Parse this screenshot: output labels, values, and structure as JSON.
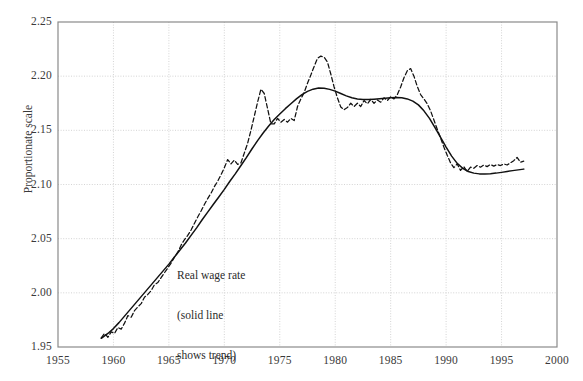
{
  "chart_data": {
    "type": "line",
    "title": "",
    "subtitle": "",
    "xlabel": "",
    "ylabel": "Proportionate scale",
    "xlim": [
      1955,
      2000
    ],
    "ylim": [
      1.95,
      2.25
    ],
    "xticks": [
      1955,
      1960,
      1965,
      1970,
      1975,
      1980,
      1985,
      1990,
      1995,
      2000
    ],
    "xtick_labels": [
      "1955",
      "1960",
      "1965",
      "1970",
      "1975",
      "1980",
      "1985",
      "1990",
      "1995",
      "2000"
    ],
    "yticks": [
      1.95,
      2.0,
      2.05,
      2.1,
      2.15,
      2.2,
      2.25
    ],
    "ytick_labels": [
      "1.95",
      "2.00",
      "2.05",
      "2.10",
      "2.15",
      "2.20",
      "2.25"
    ],
    "grid": true,
    "grid_style": "dotted",
    "grid_color": "#cfcfcf",
    "axis_color": "#8a8a8a",
    "legend": null,
    "legend_position": "none",
    "annotations": [
      {
        "name": "series-annotation",
        "lines": [
          "Real wage rate",
          "(solid line",
          "shows trend)"
        ],
        "x": 1965.8,
        "y": 2.047
      }
    ],
    "series": [
      {
        "name": "Real wage rate (actual)",
        "style": "dashed",
        "color": "#111111",
        "x": [
          1958.9,
          1959.2,
          1959.5,
          1959.8,
          1960.1,
          1960.4,
          1960.7,
          1961.0,
          1961.3,
          1961.6,
          1961.9,
          1962.2,
          1962.5,
          1962.8,
          1963.1,
          1963.4,
          1963.7,
          1964.0,
          1964.3,
          1964.6,
          1964.9,
          1965.2,
          1965.5,
          1965.8,
          1966.1,
          1966.4,
          1966.7,
          1967.0,
          1967.3,
          1967.6,
          1967.9,
          1968.2,
          1968.5,
          1968.8,
          1969.1,
          1969.4,
          1969.7,
          1970.0,
          1970.3,
          1970.6,
          1970.9,
          1971.2,
          1971.5,
          1971.8,
          1972.1,
          1972.4,
          1972.7,
          1973.0,
          1973.3,
          1973.6,
          1973.9,
          1974.2,
          1974.5,
          1974.8,
          1975.1,
          1975.4,
          1975.7,
          1976.0,
          1976.3,
          1976.6,
          1976.9,
          1977.2,
          1977.5,
          1977.8,
          1978.1,
          1978.4,
          1978.7,
          1979.0,
          1979.3,
          1979.6,
          1979.9,
          1980.2,
          1980.5,
          1980.8,
          1981.1,
          1981.4,
          1981.7,
          1982.0,
          1982.3,
          1982.6,
          1982.9,
          1983.2,
          1983.5,
          1983.8,
          1984.1,
          1984.4,
          1984.7,
          1985.0,
          1985.3,
          1985.6,
          1985.9,
          1986.2,
          1986.5,
          1986.8,
          1987.1,
          1987.4,
          1987.7,
          1988.0,
          1988.3,
          1988.6,
          1988.9,
          1989.2,
          1989.5,
          1989.8,
          1990.1,
          1990.4,
          1990.7,
          1991.0,
          1991.3,
          1991.6,
          1991.9,
          1992.2,
          1992.5,
          1992.8,
          1993.1,
          1993.4,
          1993.7,
          1994.0,
          1994.3,
          1994.6,
          1994.9,
          1995.2,
          1995.5,
          1995.8,
          1996.1,
          1996.4,
          1996.7,
          1997.0
        ],
        "y": [
          1.9585,
          1.9625,
          1.959,
          1.964,
          1.9625,
          1.968,
          1.9665,
          1.972,
          1.979,
          1.9775,
          1.9835,
          1.987,
          1.99,
          1.996,
          1.9985,
          2.002,
          2.0075,
          2.0095,
          2.014,
          2.0185,
          2.023,
          2.0275,
          2.033,
          2.0375,
          2.044,
          2.049,
          2.053,
          2.058,
          2.064,
          2.07,
          2.0755,
          2.0815,
          2.087,
          2.092,
          2.098,
          2.103,
          2.109,
          2.1155,
          2.123,
          2.119,
          2.1225,
          2.1185,
          2.12,
          2.129,
          2.138,
          2.15,
          2.163,
          2.176,
          2.188,
          2.184,
          2.17,
          2.156,
          2.156,
          2.161,
          2.1575,
          2.16,
          2.1575,
          2.161,
          2.159,
          2.172,
          2.179,
          2.185,
          2.1935,
          2.201,
          2.209,
          2.2165,
          2.2185,
          2.2175,
          2.213,
          2.202,
          2.19,
          2.18,
          2.1715,
          2.169,
          2.171,
          2.175,
          2.172,
          2.175,
          2.172,
          2.1775,
          2.1745,
          2.1785,
          2.175,
          2.178,
          2.176,
          2.18,
          2.1775,
          2.181,
          2.179,
          2.183,
          2.19,
          2.1985,
          2.205,
          2.207,
          2.2,
          2.1905,
          2.183,
          2.179,
          2.1745,
          2.168,
          2.1595,
          2.151,
          2.143,
          2.1345,
          2.127,
          2.12,
          2.1155,
          2.119,
          2.113,
          2.1165,
          2.112,
          2.116,
          2.115,
          2.1175,
          2.116,
          2.118,
          2.1165,
          2.1185,
          2.117,
          2.1185,
          2.1175,
          2.119,
          2.118,
          2.12,
          2.122,
          2.125,
          2.1205,
          2.1215
        ]
      },
      {
        "name": "Real wage rate (trend)",
        "style": "solid",
        "color": "#111111",
        "x": [
          1958.9,
          1959.5,
          1960.0,
          1960.5,
          1961.0,
          1961.5,
          1962.0,
          1962.5,
          1963.0,
          1963.5,
          1964.0,
          1964.5,
          1965.0,
          1965.5,
          1966.0,
          1966.5,
          1967.0,
          1967.5,
          1968.0,
          1968.5,
          1969.0,
          1969.5,
          1970.0,
          1970.5,
          1971.0,
          1971.5,
          1972.0,
          1972.5,
          1973.0,
          1973.5,
          1974.0,
          1974.5,
          1975.0,
          1975.5,
          1976.0,
          1976.5,
          1977.0,
          1977.5,
          1978.0,
          1978.5,
          1979.0,
          1979.5,
          1980.0,
          1980.5,
          1981.0,
          1981.5,
          1982.0,
          1982.5,
          1983.0,
          1983.5,
          1984.0,
          1984.5,
          1985.0,
          1985.5,
          1986.0,
          1986.5,
          1987.0,
          1987.5,
          1988.0,
          1988.5,
          1989.0,
          1989.5,
          1990.0,
          1990.5,
          1991.0,
          1991.5,
          1992.0,
          1992.5,
          1993.0,
          1993.5,
          1994.0,
          1994.5,
          1995.0,
          1995.5,
          1996.0,
          1996.5,
          1997.0
        ],
        "y": [
          1.958,
          1.9625,
          1.967,
          1.9725,
          1.9785,
          1.9845,
          1.9905,
          1.9965,
          2.0025,
          2.0085,
          2.0145,
          2.0205,
          2.0265,
          2.033,
          2.0395,
          2.046,
          2.053,
          2.06,
          2.0675,
          2.0745,
          2.0815,
          2.0885,
          2.0955,
          2.103,
          2.11,
          2.1175,
          2.125,
          2.133,
          2.1405,
          2.1475,
          2.154,
          2.16,
          2.165,
          2.17,
          2.1745,
          2.179,
          2.183,
          2.186,
          2.188,
          2.189,
          2.1888,
          2.1878,
          2.1862,
          2.184,
          2.1818,
          2.18,
          2.179,
          2.1785,
          2.1785,
          2.1788,
          2.1792,
          2.1796,
          2.18,
          2.1802,
          2.18,
          2.179,
          2.177,
          2.1735,
          2.168,
          2.161,
          2.1525,
          2.1435,
          2.1345,
          2.1262,
          2.1195,
          2.115,
          2.112,
          2.1105,
          2.1098,
          2.1098,
          2.11,
          2.1105,
          2.1112,
          2.112,
          2.1128,
          2.1135,
          2.1142
        ]
      }
    ]
  },
  "figure": {
    "background": "#ffffff",
    "plot_left": 58,
    "plot_top": 22,
    "plot_right": 557,
    "plot_bottom": 347
  }
}
